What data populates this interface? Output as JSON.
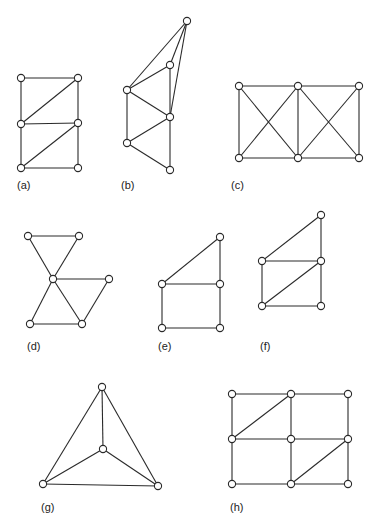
{
  "figure": {
    "node_radius": 3.6,
    "colors": {
      "line": "#2a2a2a",
      "node_fill": "#ffffff",
      "background": "#ffffff"
    },
    "graphs": [
      {
        "id": "a",
        "label": "(a)",
        "label_pos": [
          17,
          180
        ],
        "nodes": [
          [
            21,
            78
          ],
          [
            78,
            78
          ],
          [
            21,
            124
          ],
          [
            78,
            123
          ],
          [
            21,
            168
          ],
          [
            78,
            168
          ]
        ],
        "edges": [
          [
            0,
            1
          ],
          [
            0,
            2
          ],
          [
            1,
            3
          ],
          [
            1,
            2
          ],
          [
            2,
            3
          ],
          [
            2,
            4
          ],
          [
            3,
            5
          ],
          [
            3,
            4
          ],
          [
            4,
            5
          ]
        ]
      },
      {
        "id": "b",
        "label": "(b)",
        "label_pos": [
          121,
          180
        ],
        "nodes": [
          [
            187,
            21
          ],
          [
            170,
            65
          ],
          [
            127,
            90
          ],
          [
            170,
            117
          ],
          [
            127,
            143
          ],
          [
            170,
            170
          ]
        ],
        "edges": [
          [
            0,
            1
          ],
          [
            0,
            2
          ],
          [
            0,
            3
          ],
          [
            1,
            2
          ],
          [
            1,
            3
          ],
          [
            2,
            3
          ],
          [
            2,
            4
          ],
          [
            3,
            4
          ],
          [
            3,
            5
          ],
          [
            4,
            5
          ]
        ]
      },
      {
        "id": "c",
        "label": "(c)",
        "label_pos": [
          231,
          180
        ],
        "nodes": [
          [
            239,
            86
          ],
          [
            298,
            86
          ],
          [
            359,
            86
          ],
          [
            239,
            158
          ],
          [
            298,
            158
          ],
          [
            359,
            158
          ]
        ],
        "edges": [
          [
            0,
            1
          ],
          [
            1,
            2
          ],
          [
            0,
            3
          ],
          [
            1,
            4
          ],
          [
            2,
            5
          ],
          [
            3,
            4
          ],
          [
            4,
            5
          ],
          [
            0,
            4
          ],
          [
            1,
            3
          ],
          [
            1,
            5
          ],
          [
            2,
            4
          ]
        ]
      },
      {
        "id": "d",
        "label": "(d)",
        "label_pos": [
          27,
          341
        ],
        "nodes": [
          [
            28,
            236
          ],
          [
            79,
            236
          ],
          [
            53,
            279
          ],
          [
            109,
            279
          ],
          [
            30,
            324
          ],
          [
            82,
            324
          ]
        ],
        "edges": [
          [
            0,
            1
          ],
          [
            0,
            2
          ],
          [
            1,
            2
          ],
          [
            2,
            3
          ],
          [
            2,
            4
          ],
          [
            2,
            5
          ],
          [
            4,
            5
          ],
          [
            5,
            3
          ]
        ]
      },
      {
        "id": "e",
        "label": "(e)",
        "label_pos": [
          158,
          341
        ],
        "nodes": [
          [
            220,
            237
          ],
          [
            162,
            284
          ],
          [
            220,
            284
          ],
          [
            162,
            328
          ],
          [
            220,
            328
          ]
        ],
        "edges": [
          [
            0,
            1
          ],
          [
            0,
            2
          ],
          [
            1,
            2
          ],
          [
            1,
            3
          ],
          [
            2,
            4
          ],
          [
            3,
            4
          ]
        ]
      },
      {
        "id": "f",
        "label": "(f)",
        "label_pos": [
          260,
          341
        ],
        "nodes": [
          [
            321,
            215
          ],
          [
            262,
            261
          ],
          [
            321,
            261
          ],
          [
            262,
            306
          ],
          [
            321,
            306
          ]
        ],
        "edges": [
          [
            0,
            1
          ],
          [
            0,
            2
          ],
          [
            1,
            2
          ],
          [
            1,
            3
          ],
          [
            2,
            4
          ],
          [
            3,
            4
          ],
          [
            3,
            2
          ]
        ]
      },
      {
        "id": "g",
        "label": "(g)",
        "label_pos": [
          41,
          502
        ],
        "nodes": [
          [
            102,
            387
          ],
          [
            103,
            449
          ],
          [
            43,
            484
          ],
          [
            158,
            486
          ]
        ],
        "edges": [
          [
            0,
            1
          ],
          [
            0,
            2
          ],
          [
            0,
            3
          ],
          [
            1,
            2
          ],
          [
            1,
            3
          ],
          [
            2,
            3
          ]
        ]
      },
      {
        "id": "h",
        "label": "(h)",
        "label_pos": [
          230,
          502
        ],
        "nodes": [
          [
            232,
            394
          ],
          [
            291,
            394
          ],
          [
            348,
            394
          ],
          [
            232,
            439
          ],
          [
            291,
            439
          ],
          [
            348,
            439
          ],
          [
            232,
            484
          ],
          [
            291,
            484
          ],
          [
            348,
            484
          ]
        ],
        "edges": [
          [
            0,
            1
          ],
          [
            1,
            2
          ],
          [
            3,
            4
          ],
          [
            4,
            5
          ],
          [
            6,
            7
          ],
          [
            7,
            8
          ],
          [
            0,
            3
          ],
          [
            3,
            6
          ],
          [
            1,
            4
          ],
          [
            4,
            7
          ],
          [
            2,
            5
          ],
          [
            5,
            8
          ],
          [
            3,
            1
          ],
          [
            7,
            5
          ]
        ]
      }
    ]
  },
  "labels": {
    "a": "(a)",
    "b": "(b)",
    "c": "(c)",
    "d": "(d)",
    "e": "(e)",
    "f": "(f)",
    "g": "(g)",
    "h": "(h)"
  }
}
